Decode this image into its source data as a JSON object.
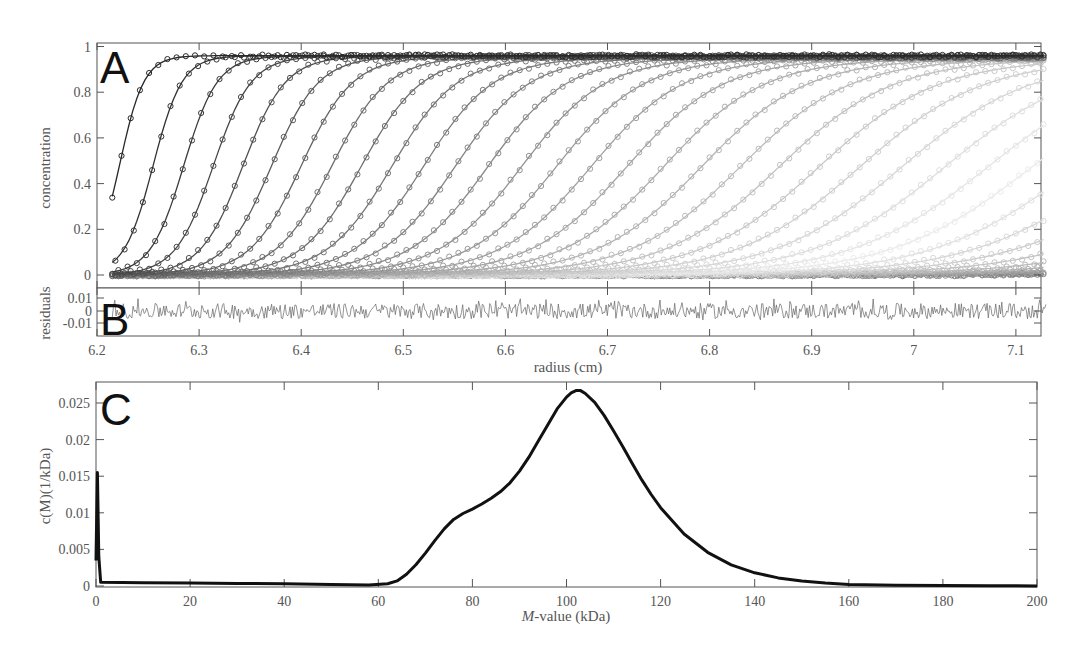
{
  "figure": {
    "panels": [
      "A",
      "B",
      "C"
    ]
  },
  "chart_data": [
    {
      "panel": "A",
      "type": "scatter",
      "title": "",
      "xlabel": "radius (cm)",
      "ylabel": "concentration",
      "xlim": [
        6.2,
        7.14
      ],
      "ylim": [
        -0.02,
        1.02
      ],
      "x_ticks": [
        6.2,
        6.3,
        6.4,
        6.5,
        6.6,
        6.7,
        6.8,
        6.9,
        7,
        7.1
      ],
      "x_tick_labels": [
        "6.2",
        "6.3",
        "6.4",
        "6.5",
        "6.6",
        "6.7",
        "6.8",
        "6.9",
        "7",
        "7.1"
      ],
      "y_ticks": [
        0,
        0.2,
        0.4,
        0.6,
        0.8,
        1
      ],
      "y_tick_labels": [
        "0",
        "0.2",
        "0.4",
        "0.6",
        "0.8",
        "1"
      ],
      "grid": false,
      "description": "Sedimentation boundary profiles (open circles = data, lines = fit) at successive scan times; boundaries move to larger radius and become lighter gray over time",
      "data_range_x": [
        6.215,
        7.13
      ],
      "plateau": 0.96,
      "series_count": 40,
      "boundary_midpoints_cm": [
        6.222,
        6.255,
        6.285,
        6.314,
        6.343,
        6.371,
        6.4,
        6.43,
        6.459,
        6.489,
        6.52,
        6.551,
        6.583,
        6.616,
        6.65,
        6.684,
        6.719,
        6.755,
        6.792,
        6.83,
        6.868,
        6.907,
        6.947,
        6.988,
        7.03,
        7.072,
        7.115,
        7.16,
        7.205,
        7.25,
        7.3,
        7.35,
        7.4,
        7.45,
        7.5,
        7.55,
        7.6,
        7.65,
        7.7,
        7.75
      ],
      "boundary_width_start_cm": 0.012,
      "boundary_width_growth_cm": 0.0022
    },
    {
      "panel": "B",
      "type": "line",
      "xlabel": "radius (cm)",
      "ylabel": "residuals",
      "xlim": [
        6.2,
        7.14
      ],
      "ylim": [
        -0.018,
        0.018
      ],
      "y_ticks": [
        0.01,
        0,
        -0.01
      ],
      "y_tick_labels": [
        "0.01",
        "0",
        "-0.01"
      ],
      "description": "Fit residuals, random noise within about +/-0.01 across 6.215-7.13 cm",
      "noise_amplitude": 0.007
    },
    {
      "panel": "C",
      "type": "line",
      "title": "",
      "xlabel_italic": "M",
      "xlabel_rest": "-value (kDa)",
      "ylabel": "c(M)(1/kDa)",
      "xlim": [
        0,
        200
      ],
      "ylim": [
        0,
        0.028
      ],
      "x_ticks": [
        0,
        20,
        40,
        60,
        80,
        100,
        120,
        140,
        160,
        180,
        200
      ],
      "x_tick_labels": [
        "0",
        "20",
        "40",
        "60",
        "80",
        "100",
        "120",
        "140",
        "160",
        "180",
        "200"
      ],
      "y_ticks": [
        0,
        0.005,
        0.01,
        0.015,
        0.02,
        0.025
      ],
      "y_tick_labels": [
        "0",
        "0.005",
        "0.01",
        "0.015",
        "0.02",
        "0.025"
      ],
      "grid": false,
      "x": [
        0,
        0.3,
        0.6,
        1,
        10,
        20,
        30,
        40,
        50,
        58,
        62,
        64,
        66,
        68,
        70,
        72,
        74,
        76,
        78,
        80,
        82,
        84,
        86,
        88,
        90,
        92,
        94,
        96,
        98,
        100,
        101,
        102,
        103,
        104,
        106,
        108,
        110,
        112,
        114,
        116,
        118,
        120,
        125,
        130,
        135,
        140,
        145,
        150,
        155,
        160,
        170,
        180,
        190,
        200
      ],
      "values": [
        0.0035,
        0.0155,
        0.004,
        0.0005,
        0.00045,
        0.0004,
        0.00035,
        0.0003,
        0.00022,
        0.00015,
        0.0003,
        0.0007,
        0.0016,
        0.0029,
        0.0045,
        0.0062,
        0.0078,
        0.0091,
        0.0099,
        0.0105,
        0.0112,
        0.012,
        0.0129,
        0.0141,
        0.0157,
        0.0176,
        0.0198,
        0.022,
        0.0242,
        0.0258,
        0.0264,
        0.0267,
        0.0267,
        0.0263,
        0.0251,
        0.0233,
        0.0212,
        0.019,
        0.0167,
        0.0145,
        0.0125,
        0.0107,
        0.0071,
        0.0046,
        0.0029,
        0.0018,
        0.0011,
        0.0007,
        0.0004,
        0.0002,
        0.0001,
        5e-05,
        3e-05,
        2e-05
      ]
    }
  ]
}
